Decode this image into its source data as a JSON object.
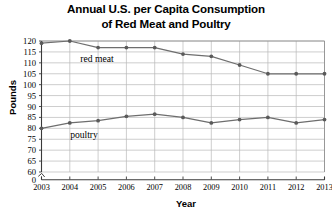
{
  "chart_data": {
    "type": "line",
    "title": "Annual U.S. per Capita Consumption of Red Meat and Poultry",
    "title_lines": [
      "Annual U.S. per Capita Consumption",
      "of Red Meat and Poultry"
    ],
    "xlabel": "Year",
    "ylabel": "Pounds",
    "x": [
      2003,
      2004,
      2005,
      2006,
      2007,
      2008,
      2009,
      2010,
      2011,
      2012,
      2013
    ],
    "categories": [
      "2003",
      "2004",
      "2005",
      "2006",
      "2007",
      "2008",
      "2009",
      "2010",
      "2011",
      "2012",
      "2013"
    ],
    "xlim": [
      2003,
      2013
    ],
    "ylim": [
      60,
      120
    ],
    "yticks": [
      60,
      65,
      70,
      75,
      80,
      85,
      90,
      95,
      100,
      105,
      110,
      115,
      120
    ],
    "ytick_labels": [
      "60",
      "65",
      "70",
      "75",
      "80",
      "85",
      "90",
      "95",
      "100",
      "105",
      "110",
      "115",
      "120"
    ],
    "axis_origin_label": "0",
    "axis_break": true,
    "grid": true,
    "legend_position": "inline-annotation",
    "series": [
      {
        "name": "red meat",
        "label": "red meat",
        "color": "#6e6e6e",
        "values": [
          119,
          120,
          117,
          117,
          117,
          114,
          113,
          109,
          105,
          105,
          105
        ]
      },
      {
        "name": "poultry",
        "label": "poultry",
        "color": "#6e6e6e",
        "values": [
          80,
          82.5,
          83.5,
          85.5,
          86.5,
          85,
          82.5,
          84,
          85,
          82.5,
          84
        ]
      }
    ]
  }
}
